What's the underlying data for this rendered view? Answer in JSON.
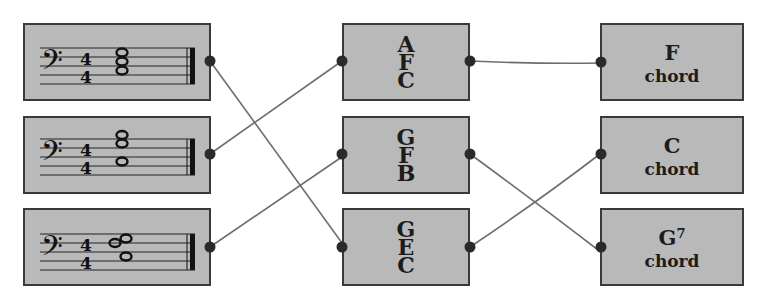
{
  "diagram": {
    "type": "matching-exercise",
    "colors": {
      "box_fill": "#b9b9b9",
      "box_border": "#3a3a3a",
      "wire": "#6e6e6e",
      "dot": "#2a2a2a",
      "background": "#ffffff"
    },
    "left_column": [
      {
        "id": "staff-1",
        "clef": "bass",
        "time_signature": "4/4",
        "notes_description": "A F C stacked chord (whole notes)"
      },
      {
        "id": "staff-2",
        "clef": "bass",
        "time_signature": "4/4",
        "notes_description": "G F B chord (whole notes)"
      },
      {
        "id": "staff-3",
        "clef": "bass",
        "time_signature": "4/4",
        "notes_description": "G E C chord (whole notes)"
      }
    ],
    "middle_column": [
      {
        "id": "notes-1",
        "letters": [
          "A",
          "F",
          "C"
        ]
      },
      {
        "id": "notes-2",
        "letters": [
          "G",
          "F",
          "B"
        ]
      },
      {
        "id": "notes-3",
        "letters": [
          "G",
          "E",
          "C"
        ]
      }
    ],
    "right_column": [
      {
        "id": "chord-1",
        "name": "F",
        "superscript": "",
        "word": "chord"
      },
      {
        "id": "chord-2",
        "name": "C",
        "superscript": "",
        "word": "chord"
      },
      {
        "id": "chord-3",
        "name": "G",
        "superscript": "7",
        "word": "chord"
      }
    ],
    "connections_left_to_middle": [
      {
        "from": "staff-1",
        "to": "notes-3"
      },
      {
        "from": "staff-2",
        "to": "notes-1"
      },
      {
        "from": "staff-3",
        "to": "notes-2"
      }
    ],
    "connections_middle_to_right": [
      {
        "from": "notes-1",
        "to": "chord-1"
      },
      {
        "from": "notes-2",
        "to": "chord-3"
      },
      {
        "from": "notes-3",
        "to": "chord-2"
      }
    ]
  }
}
